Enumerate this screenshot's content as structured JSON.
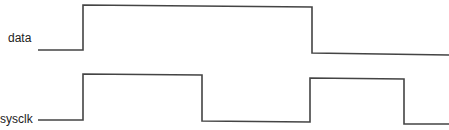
{
  "diagram": {
    "type": "timing-diagram",
    "line_color": "#444444",
    "signals": [
      {
        "name": "data",
        "label": "data",
        "points": [
          [
            38,
            50
          ],
          [
            83,
            50
          ],
          [
            83,
            5
          ],
          [
            312,
            7
          ],
          [
            312,
            53
          ],
          [
            449,
            55
          ]
        ]
      },
      {
        "name": "sysclk",
        "label": "sysclk",
        "points": [
          [
            38,
            120
          ],
          [
            83,
            120
          ],
          [
            83,
            74
          ],
          [
            202,
            75
          ],
          [
            202,
            121
          ],
          [
            310,
            122
          ],
          [
            310,
            78
          ],
          [
            404,
            79
          ],
          [
            404,
            124
          ],
          [
            449,
            124
          ]
        ]
      }
    ]
  }
}
